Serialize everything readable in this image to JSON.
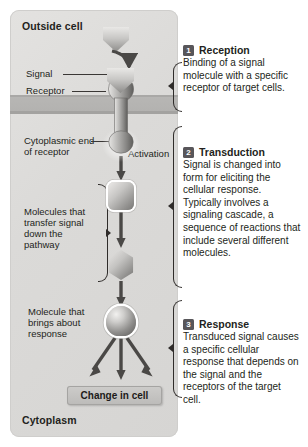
{
  "diagram": {
    "regions": {
      "outside_cell": "Outside cell",
      "cytoplasm": "Cytoplasm"
    },
    "labels": {
      "signal": "Signal",
      "receptor": "Receptor",
      "cytoplasmic_end": "Cytoplasmic end of receptor",
      "activation": "Activation",
      "molecules_transfer": "Molecules that transfer signal down the pathway",
      "molecule_response": "Molecule that brings about response"
    },
    "outcome_box": "Change in cell"
  },
  "steps": [
    {
      "number": "1",
      "title": "Reception",
      "body": "Binding of a signal molecule with a specific receptor of target cells."
    },
    {
      "number": "2",
      "title": "Transduction",
      "body": "Signal is changed into form for eliciting the cellular response. Typically involves a signaling cascade, a sequence of reactions that include several different molecules."
    },
    {
      "number": "3",
      "title": "Response",
      "body": "Transduced signal causes a specific cellular response that depends on the signal and the receptors of the target cell."
    }
  ],
  "colors": {
    "panel_background": "#dbdad8",
    "membrane": "#b3b2b0",
    "badge": "#58565a",
    "ink": "#231f20",
    "arrow": "#4a4846"
  }
}
